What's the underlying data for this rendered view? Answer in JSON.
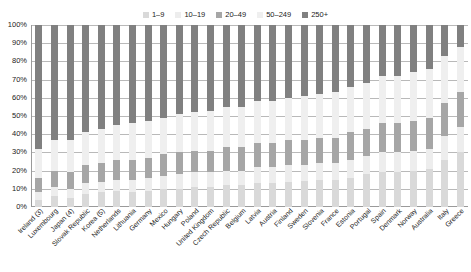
{
  "chart_data": {
    "type": "bar",
    "subtype": "stacked-bar-100pct",
    "title": "",
    "subtitle": "",
    "xlabel": "",
    "ylabel": "",
    "ylim": [
      0,
      100
    ],
    "grid": true,
    "legend_position": "top-center",
    "y_tick_labels": [
      "100%",
      "90%",
      "80%",
      "70%",
      "60%",
      "50%",
      "40%",
      "30%",
      "20%",
      "10%",
      "0%"
    ],
    "y_tick_values": [
      100,
      90,
      80,
      70,
      60,
      50,
      40,
      30,
      20,
      10,
      0
    ],
    "categories": [
      "Ireland (3)",
      "Luxembourg",
      "Japan (4)",
      "Slovak Republic",
      "Korea (5)",
      "Netherlands",
      "Lithuania",
      "Germany",
      "Mexico",
      "Hungary",
      "Poland",
      "United Kingdom",
      "Czech Republic",
      "Belgium",
      "Latvia",
      "Austria",
      "Finland",
      "Sweden",
      "Slovenia",
      "France",
      "Estonia",
      "Portugal",
      "Spain",
      "Denmark",
      "Norway",
      "Australia",
      "Italy",
      "Greece"
    ],
    "series": [
      {
        "name": "1–9",
        "color": "#d9d9d9",
        "values": [
          4,
          6,
          5,
          7,
          8,
          9,
          8,
          9,
          10,
          10,
          11,
          11,
          12,
          12,
          13,
          13,
          14,
          14,
          15,
          15,
          16,
          18,
          19,
          19,
          20,
          21,
          26,
          30
        ]
      },
      {
        "name": "10–19",
        "color": "#ededed",
        "values": [
          4,
          5,
          5,
          6,
          6,
          6,
          7,
          7,
          7,
          8,
          8,
          8,
          8,
          8,
          9,
          9,
          9,
          9,
          9,
          9,
          10,
          10,
          11,
          11,
          11,
          11,
          13,
          14
        ]
      },
      {
        "name": "20–49",
        "color": "#a6a6a6",
        "values": [
          8,
          9,
          9,
          10,
          10,
          11,
          11,
          11,
          12,
          12,
          12,
          12,
          13,
          13,
          13,
          13,
          14,
          14,
          14,
          14,
          15,
          15,
          16,
          16,
          16,
          17,
          18,
          19
        ]
      },
      {
        "name": "50–249",
        "color": "#efefef",
        "values": [
          16,
          17,
          18,
          18,
          19,
          19,
          20,
          20,
          20,
          21,
          21,
          22,
          22,
          22,
          23,
          23,
          23,
          24,
          24,
          25,
          25,
          25,
          26,
          26,
          27,
          27,
          26,
          25
        ]
      },
      {
        "name": "250+",
        "color": "#808080",
        "values": [
          68,
          63,
          63,
          59,
          57,
          55,
          54,
          53,
          51,
          49,
          48,
          47,
          45,
          45,
          42,
          42,
          40,
          39,
          38,
          37,
          34,
          32,
          28,
          28,
          26,
          24,
          17,
          12
        ]
      }
    ]
  },
  "legend": {
    "items": [
      {
        "label": "1–9",
        "color": "#d9d9d9"
      },
      {
        "label": "10–19",
        "color": "#ededed"
      },
      {
        "label": "20–49",
        "color": "#a6a6a6"
      },
      {
        "label": "50–249",
        "color": "#efefef"
      },
      {
        "label": "250+",
        "color": "#808080"
      }
    ]
  }
}
